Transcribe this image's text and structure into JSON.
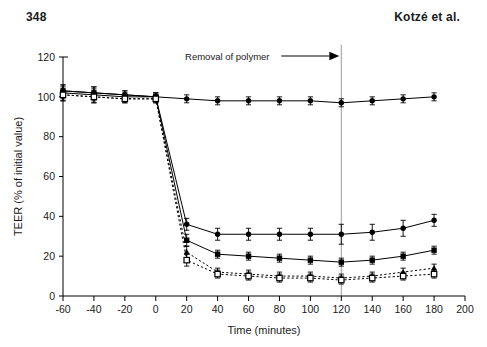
{
  "header": {
    "folio": "348",
    "running_head": "Kotzé et al."
  },
  "chart_data": {
    "type": "line",
    "title": "",
    "xlabel": "Time (minutes)",
    "ylabel": "TEER (% of initial value)",
    "xlim": [
      -60,
      200
    ],
    "ylim": [
      0,
      120
    ],
    "xticks": [
      -60,
      -40,
      -20,
      0,
      20,
      40,
      60,
      80,
      100,
      120,
      140,
      160,
      180,
      200
    ],
    "yticks": [
      0,
      20,
      40,
      60,
      80,
      100,
      120
    ],
    "xtick_labels": [
      "-60",
      "-40",
      "-20",
      "0",
      "20",
      "40",
      "60",
      "80",
      "100",
      "120",
      "140",
      "160",
      "180",
      "200"
    ],
    "ytick_labels": [
      "0",
      "20",
      "40",
      "60",
      "80",
      "100",
      "120"
    ],
    "grid": false,
    "legend": "none",
    "x": [
      -60,
      -40,
      -20,
      0,
      20,
      40,
      60,
      80,
      100,
      120,
      140,
      160,
      180
    ],
    "series": [
      {
        "name": "control",
        "marker": "filled-circle",
        "line": "solid",
        "color": "#000000",
        "values": [
          103,
          102,
          101,
          100,
          99,
          98,
          98,
          98,
          98,
          97,
          98,
          99,
          100
        ],
        "errors": [
          3,
          3,
          2,
          2,
          2,
          2,
          2,
          2,
          2,
          2,
          2,
          2,
          2
        ]
      },
      {
        "name": "series-2",
        "marker": "filled-circle",
        "line": "solid",
        "color": "#000000",
        "values": [
          103,
          102,
          101,
          100,
          36,
          31,
          31,
          31,
          31,
          31,
          32,
          34,
          38
        ],
        "errors": [
          3,
          3,
          2,
          2,
          3,
          3,
          3,
          3,
          3,
          5,
          4,
          4,
          3
        ]
      },
      {
        "name": "series-3",
        "marker": "filled-square",
        "line": "solid",
        "color": "#000000",
        "values": [
          102,
          101,
          100,
          100,
          28,
          21,
          20,
          19,
          18,
          17,
          18,
          20,
          23
        ],
        "errors": [
          3,
          3,
          2,
          2,
          3,
          2,
          2,
          2,
          2,
          2,
          2,
          2,
          2
        ]
      },
      {
        "name": "series-4",
        "marker": "filled-triangle",
        "line": "dotted",
        "color": "#000000",
        "values": [
          101,
          100,
          99,
          99,
          22,
          12,
          11,
          10,
          10,
          9,
          10,
          12,
          14
        ],
        "errors": [
          3,
          3,
          2,
          2,
          3,
          2,
          2,
          2,
          2,
          2,
          2,
          2,
          2
        ]
      },
      {
        "name": "series-5",
        "marker": "open-square",
        "line": "dotted",
        "color": "#000000",
        "values": [
          101,
          100,
          99,
          99,
          18,
          11,
          10,
          9,
          9,
          8,
          9,
          10,
          11
        ],
        "errors": [
          3,
          3,
          2,
          2,
          3,
          2,
          2,
          2,
          2,
          2,
          2,
          2,
          2
        ]
      }
    ],
    "annotations": [
      {
        "name": "removal-of-polymer",
        "text": "Removal of polymer",
        "x": 120,
        "arrow": "right",
        "vline_x": 120
      }
    ]
  }
}
